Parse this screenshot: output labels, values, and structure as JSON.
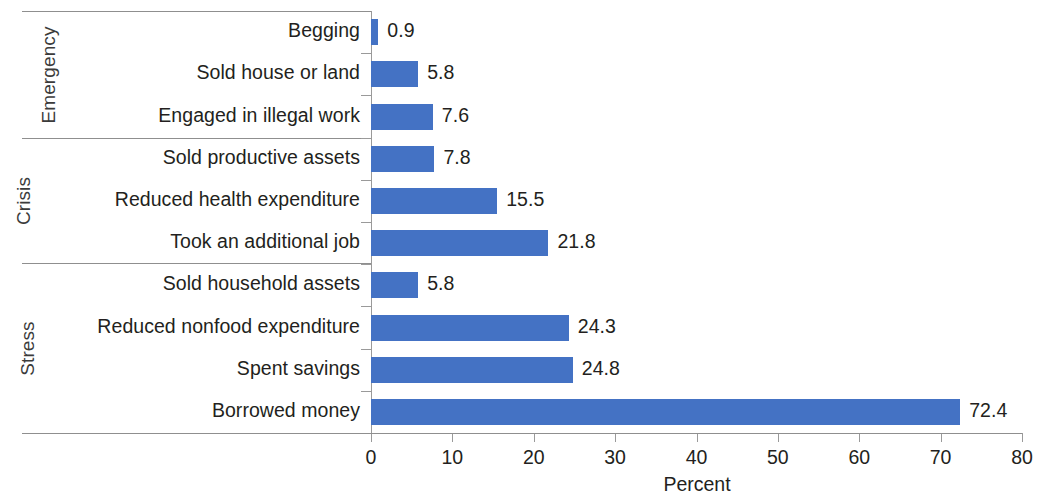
{
  "chart_data": {
    "type": "bar",
    "orientation": "horizontal",
    "title": "",
    "xlabel": "Percent",
    "ylabel": "",
    "xlim": [
      0,
      80
    ],
    "xticks": [
      "0",
      "10",
      "20",
      "30",
      "40",
      "50",
      "60",
      "70",
      "80"
    ],
    "grid": false,
    "legend": null,
    "bar_color": "#4472C4",
    "categories": [
      "Begging",
      "Sold house or land",
      "Engaged in illegal work",
      "Sold productive assets",
      "Reduced health expenditure",
      "Took an additional job",
      "Sold household assets",
      "Reduced nonfood expenditure",
      "Spent savings",
      "Borrowed money"
    ],
    "values": [
      0.9,
      5.8,
      7.6,
      7.8,
      15.5,
      21.8,
      5.8,
      24.3,
      24.8,
      72.4
    ],
    "value_labels": [
      "0.9",
      "5.8",
      "7.6",
      "7.8",
      "15.5",
      "21.8",
      "5.8",
      "24.3",
      "24.8",
      "72.4"
    ],
    "groups": [
      {
        "label": "Emergency",
        "start": 0,
        "end": 2
      },
      {
        "label": "Crisis",
        "start": 3,
        "end": 5
      },
      {
        "label": "Stress",
        "start": 6,
        "end": 9
      }
    ]
  }
}
